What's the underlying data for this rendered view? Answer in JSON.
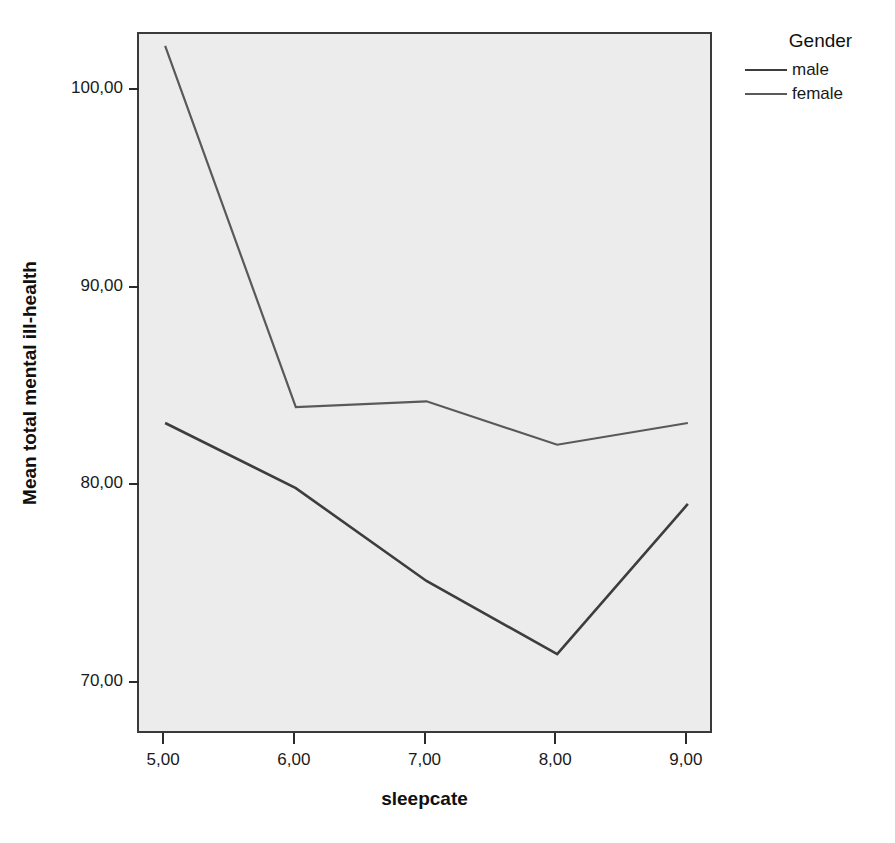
{
  "chart_data": {
    "type": "line",
    "title": "",
    "xlabel": "sleepcate",
    "ylabel": "Mean total mental ill-health",
    "x": [
      5,
      6,
      7,
      8,
      9
    ],
    "xtick_labels": [
      "5,00",
      "6,00",
      "7,00",
      "8,00",
      "9,00"
    ],
    "ytick_values": [
      100,
      90,
      80,
      70
    ],
    "ytick_labels": [
      "100,00",
      "90,00",
      "80,00",
      "70,00"
    ],
    "xlim": [
      4.8,
      9.2
    ],
    "ylim": [
      67.4,
      102.9
    ],
    "grid": false,
    "legend": {
      "title": "Gender",
      "position": "right-top"
    },
    "series": [
      {
        "name": "male",
        "color": "#3d3d3d",
        "values": [
          83.2,
          79.9,
          75.2,
          71.5,
          79.1
        ]
      },
      {
        "name": "female",
        "color": "#595959",
        "values": [
          102.3,
          84.0,
          84.3,
          82.1,
          83.2
        ]
      }
    ]
  },
  "legend": {
    "title": "Gender",
    "entries": [
      {
        "label": "male",
        "color": "#3d3d3d"
      },
      {
        "label": "female",
        "color": "#595959"
      }
    ]
  },
  "axes": {
    "x_title": "sleepcate",
    "y_title": "Mean total mental ill-health",
    "x_ticks": [
      "5,00",
      "6,00",
      "7,00",
      "8,00",
      "9,00"
    ],
    "y_ticks": [
      "100,00",
      "90,00",
      "80,00",
      "70,00"
    ]
  },
  "style": {
    "plot_background": "#ececec",
    "frame_color": "#3a3a3a",
    "page_background": "#ffffff"
  }
}
